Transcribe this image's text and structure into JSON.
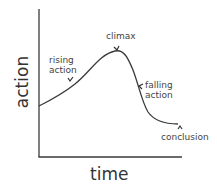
{
  "diagram": {
    "axes": {
      "x_label": "time",
      "y_label": "action"
    },
    "labels": {
      "rising_action": [
        "rising",
        "action"
      ],
      "climax": "climax",
      "falling_action": [
        "falling",
        "action"
      ],
      "conclusion": "conclusion"
    },
    "colors": {
      "line": "#3a3a3a",
      "text": "#444444",
      "background": "#ffffff"
    }
  }
}
